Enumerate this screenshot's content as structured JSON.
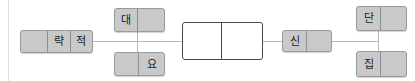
{
  "figure": {
    "type": "node-link-diagram",
    "background_color": "#ffffff",
    "node_fill": "#c9c9c9",
    "node_border": "#9a9a9a",
    "center_node_fill": "#ffffff",
    "center_node_border": "#4a4a4a",
    "connector_color": "#b9b9b9",
    "frame_rule_color": "#dcdcdc"
  },
  "nodes": [
    {
      "id": "node-left",
      "name": "node-left",
      "x": 20,
      "y": 30,
      "width": 73,
      "height": 23,
      "style": "shaded",
      "cells": [
        {
          "label": "",
          "width": 28
        },
        {
          "label": "략",
          "width": 23
        },
        {
          "label": "적",
          "width": 22
        }
      ]
    },
    {
      "id": "node-top-left",
      "name": "node-dae",
      "x": 114,
      "y": 8,
      "width": 51,
      "height": 24,
      "style": "shaded",
      "cells": [
        {
          "label": "대",
          "width": 24
        },
        {
          "label": "",
          "width": 27
        }
      ]
    },
    {
      "id": "node-bottom-left",
      "name": "node-yo",
      "x": 114,
      "y": 52,
      "width": 51,
      "height": 24,
      "style": "shaded",
      "cells": [
        {
          "label": "",
          "width": 25
        },
        {
          "label": "요",
          "width": 26
        }
      ]
    },
    {
      "id": "node-center",
      "name": "node-center-empty",
      "x": 182,
      "y": 22,
      "width": 81,
      "height": 38,
      "style": "white",
      "cells": [
        {
          "label": "",
          "width": 40
        },
        {
          "label": "",
          "width": 41
        }
      ]
    },
    {
      "id": "node-sin",
      "name": "node-sin",
      "x": 282,
      "y": 30,
      "width": 50,
      "height": 22,
      "style": "shaded",
      "cells": [
        {
          "label": "신",
          "width": 25
        },
        {
          "label": "",
          "width": 25
        }
      ]
    },
    {
      "id": "node-top-right",
      "name": "node-dan",
      "x": 356,
      "y": 6,
      "width": 51,
      "height": 25,
      "style": "shaded",
      "cells": [
        {
          "label": "단",
          "width": 25
        },
        {
          "label": "",
          "width": 26
        }
      ]
    },
    {
      "id": "node-bottom-right",
      "name": "node-jip",
      "x": 356,
      "y": 51,
      "width": 51,
      "height": 26,
      "style": "shaded",
      "cells": [
        {
          "label": "집",
          "width": 25
        },
        {
          "label": "",
          "width": 26
        }
      ]
    }
  ],
  "connectors": [
    {
      "name": "connector-left-to-branch",
      "orientation": "horizontal",
      "x": 93,
      "y": 41,
      "length": 89
    },
    {
      "name": "connector-branch-vertical-left",
      "orientation": "vertical",
      "x": 137,
      "y": 32,
      "length": 20
    },
    {
      "name": "connector-center-to-sin",
      "orientation": "horizontal",
      "x": 263,
      "y": 41,
      "length": 19
    },
    {
      "name": "connector-sin-to-branch",
      "orientation": "horizontal",
      "x": 332,
      "y": 41,
      "length": 46
    },
    {
      "name": "connector-branch-vertical-right",
      "orientation": "vertical",
      "x": 378,
      "y": 31,
      "length": 20
    }
  ]
}
